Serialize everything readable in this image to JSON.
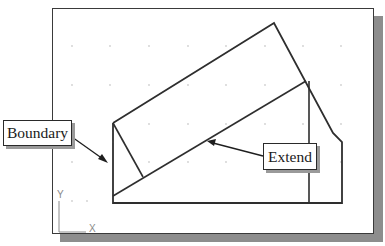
{
  "figure": {
    "cropped_caption_text": "",
    "callouts": {
      "boundary": {
        "label": "Boundary"
      },
      "extend": {
        "label": "Extend"
      }
    },
    "ucs_icon": {
      "y_label": "Y",
      "x_label": "X"
    },
    "colors": {
      "line": "#2e2e2e",
      "frame": "#3a3a3a",
      "shadow": "#8d8d8d",
      "grid_dot": "#d0d0d0",
      "ucs": "#8a8a8a"
    },
    "geometry": {
      "outer_profile": [
        [
          113,
          123
        ],
        [
          274,
          23
        ],
        [
          333,
          133
        ],
        [
          342,
          142
        ],
        [
          342,
          203
        ],
        [
          113,
          203
        ],
        [
          113,
          123
        ]
      ],
      "inner_vertical_line": [
        [
          309,
          81
        ],
        [
          309,
          203
        ]
      ],
      "extend_target_line": [
        [
          113,
          196
        ],
        [
          306,
          81
        ]
      ],
      "boundary_short_line": [
        [
          113,
          123
        ],
        [
          143,
          177
        ]
      ],
      "boundary_arrow": {
        "from": [
          72,
          137
        ],
        "to": [
          108,
          163
        ]
      },
      "extend_arrow": {
        "from": [
          263,
          156
        ],
        "to": [
          207,
          141
        ]
      }
    }
  }
}
